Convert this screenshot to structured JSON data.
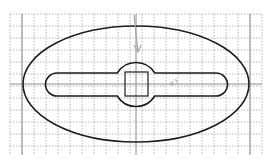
{
  "diagram": {
    "type": "cad-sketch",
    "colors": {
      "background": "#ffffff",
      "grid_dotted": "#9a9a9a",
      "axis_lines": "#8c8c8c",
      "shape_stroke": "#1e1e1e",
      "cursor": "#a8a8a8"
    },
    "grid": {
      "x_start": 10,
      "x_end": 262,
      "y_start": 14,
      "y_end": 155,
      "spacing": 12
    },
    "axes": {
      "vertical_x": [
        22,
        136,
        250
      ],
      "horizontal_y": [
        84
      ]
    },
    "ellipse": {
      "cx": 136,
      "cy": 84,
      "rx": 113,
      "ry": 58
    },
    "slot": {
      "x1": 57,
      "x2": 216,
      "cy": 84.5,
      "half_height": 11.5
    },
    "circle": {
      "cx": 136,
      "cy": 84.5,
      "r": 22
    },
    "square": {
      "x": 125,
      "y": 72,
      "w": 23,
      "h": 24
    },
    "cursor": {
      "x": 134,
      "y": 15,
      "tip_x": 138,
      "tip_y": 52
    },
    "marker": {
      "x": 172,
      "y": 84
    }
  }
}
